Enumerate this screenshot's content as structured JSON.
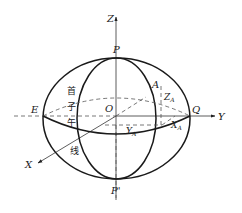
{
  "diagram": {
    "axes": {
      "x_label": "X",
      "y_label": "Y",
      "z_label": "Z"
    },
    "points": {
      "origin": "O",
      "north_pole": "P",
      "south_pole": "P'",
      "equator_west": "E",
      "equator_east": "Q",
      "point": "A"
    },
    "components": {
      "x": "X",
      "y": "Y",
      "z": "Z",
      "subscript": "A"
    },
    "meridian_label": [
      "首",
      "子",
      "午",
      "线"
    ],
    "colors": {
      "line": "#1a1a1a",
      "dashed": "#555555",
      "background": "#ffffff"
    }
  }
}
